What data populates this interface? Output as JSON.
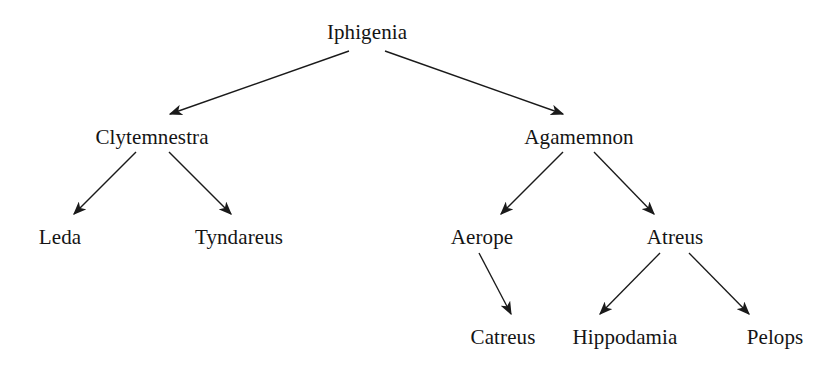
{
  "diagram": {
    "type": "tree",
    "background_color": "#ffffff",
    "line_color": "#1a1a1a",
    "text_color": "#141414",
    "nodes": [
      {
        "id": "iphigenia",
        "label": "Iphigenia",
        "level": 0,
        "cx": 367,
        "baseline": 38
      },
      {
        "id": "clytemnestra",
        "label": "Clytemnestra",
        "level": 1,
        "cx": 152,
        "baseline": 143
      },
      {
        "id": "agamemnon",
        "label": "Agamemnon",
        "level": 1,
        "cx": 579,
        "baseline": 143
      },
      {
        "id": "leda",
        "label": "Leda",
        "level": 2,
        "cx": 60,
        "baseline": 243
      },
      {
        "id": "tyndareus",
        "label": "Tyndareus",
        "level": 2,
        "cx": 239,
        "baseline": 243
      },
      {
        "id": "aerope",
        "label": "Aerope",
        "level": 2,
        "cx": 482,
        "baseline": 243
      },
      {
        "id": "atreus",
        "label": "Atreus",
        "level": 2,
        "cx": 675,
        "baseline": 243
      },
      {
        "id": "catreus",
        "label": "Catreus",
        "level": 3,
        "cx": 503,
        "baseline": 343
      },
      {
        "id": "hippodamia",
        "label": "Hippodamia",
        "level": 3,
        "cx": 625,
        "baseline": 343
      },
      {
        "id": "pelops",
        "label": "Pelops",
        "level": 3,
        "cx": 775,
        "baseline": 343
      }
    ],
    "edges": [
      {
        "id": "e1",
        "from": "iphigenia",
        "to": "clytemnestra",
        "x1": 349,
        "y1": 51,
        "x2": 170,
        "y2": 114
      },
      {
        "id": "e2",
        "from": "iphigenia",
        "to": "agamemnon",
        "x1": 385,
        "y1": 51,
        "x2": 563,
        "y2": 114
      },
      {
        "id": "e3",
        "from": "clytemnestra",
        "to": "leda",
        "x1": 136,
        "y1": 152,
        "x2": 74,
        "y2": 214
      },
      {
        "id": "e4",
        "from": "clytemnestra",
        "to": "tyndareus",
        "x1": 169,
        "y1": 152,
        "x2": 231,
        "y2": 214
      },
      {
        "id": "e5",
        "from": "agamemnon",
        "to": "aerope",
        "x1": 563,
        "y1": 152,
        "x2": 501,
        "y2": 214
      },
      {
        "id": "e6",
        "from": "agamemnon",
        "to": "atreus",
        "x1": 594,
        "y1": 152,
        "x2": 654,
        "y2": 214
      },
      {
        "id": "e7",
        "from": "aerope",
        "to": "catreus",
        "x1": 479,
        "y1": 253,
        "x2": 511,
        "y2": 314
      },
      {
        "id": "e8",
        "from": "atreus",
        "to": "hippodamia",
        "x1": 660,
        "y1": 253,
        "x2": 600,
        "y2": 314
      },
      {
        "id": "e9",
        "from": "atreus",
        "to": "pelops",
        "x1": 689,
        "y1": 253,
        "x2": 749,
        "y2": 314
      }
    ]
  }
}
